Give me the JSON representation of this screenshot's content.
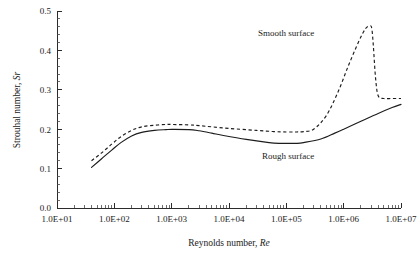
{
  "chart_data": {
    "type": "line",
    "title": "",
    "xlabel": "Reynolds number, Re",
    "xlabel_text": "Reynolds number, ",
    "xlabel_symbol": "Re",
    "ylabel": "Strouhal number, Sr",
    "ylabel_text": "Strouhal number, ",
    "ylabel_symbol": "Sr",
    "xscale": "log",
    "xlim": [
      10,
      10000000
    ],
    "ylim": [
      0.0,
      0.5
    ],
    "grid": false,
    "legend_position": "inline-annotations",
    "xticks": [
      10,
      100,
      1000,
      10000,
      100000,
      1000000,
      10000000
    ],
    "xtick_labels": [
      "1.0E+01",
      "1.0E+02",
      "1.0E+03",
      "1.0E+04",
      "1.0E+05",
      "1.0E+06",
      "1.0E+07"
    ],
    "yticks": [
      0.0,
      0.1,
      0.2,
      0.3,
      0.4,
      0.5
    ],
    "ytick_labels": [
      "0.0",
      "0.1",
      "0.2",
      "0.3",
      "0.4",
      "0.5"
    ],
    "yminor_step": 0.02,
    "line_color": "#1c1c1c",
    "series": [
      {
        "name": "Rough surface",
        "style": "solid",
        "annotation": "Rough surface",
        "annotation_x": 1300000,
        "annotation_y": 0.135,
        "x": [
          40,
          60,
          90,
          130,
          200,
          300,
          500,
          800,
          1000,
          2000,
          3000,
          5000,
          8000,
          20000,
          50000,
          80000,
          100000,
          150000,
          200000,
          400000,
          700000,
          1000000,
          2000000,
          4000000,
          7000000,
          10000000
        ],
        "y": [
          0.103,
          0.125,
          0.147,
          0.166,
          0.183,
          0.192,
          0.197,
          0.199,
          0.1995,
          0.199,
          0.196,
          0.19,
          0.184,
          0.174,
          0.166,
          0.164,
          0.164,
          0.164,
          0.166,
          0.175,
          0.19,
          0.2,
          0.22,
          0.24,
          0.255,
          0.263
        ]
      },
      {
        "name": "Smooth surface",
        "style": "dashed",
        "annotation": "Smooth surface",
        "annotation_x": 330000,
        "annotation_y": 0.432,
        "x": [
          40,
          60,
          90,
          130,
          200,
          300,
          500,
          800,
          1000,
          2000,
          3000,
          5000,
          10000,
          30000,
          60000,
          100000,
          150000,
          200000,
          300000,
          500000,
          800000,
          1200000,
          1800000,
          2400000,
          2900000,
          3100000,
          3300000,
          3600000,
          4000000,
          5000000,
          7000000,
          10000000
        ],
        "y": [
          0.12,
          0.14,
          0.162,
          0.181,
          0.197,
          0.206,
          0.21,
          0.212,
          0.212,
          0.211,
          0.209,
          0.206,
          0.202,
          0.197,
          0.194,
          0.193,
          0.193,
          0.194,
          0.2,
          0.235,
          0.295,
          0.36,
          0.42,
          0.455,
          0.462,
          0.455,
          0.41,
          0.33,
          0.285,
          0.278,
          0.278,
          0.278
        ]
      }
    ]
  },
  "annotations": {
    "smooth": "Smooth surface",
    "rough": "Rough surface"
  }
}
